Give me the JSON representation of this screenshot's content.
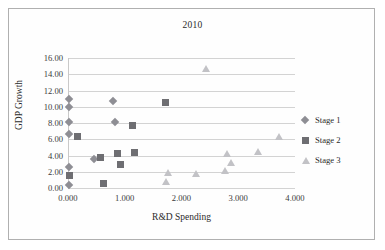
{
  "chart_data": {
    "type": "scatter",
    "title": "2010",
    "xlabel": "R&D Spending",
    "ylabel": "GDP Growth",
    "xlim": [
      0,
      4
    ],
    "ylim": [
      0,
      16
    ],
    "xticks": [
      "0.000",
      "1.000",
      "2.000",
      "3.000",
      "4.000"
    ],
    "xtick_values": [
      0,
      1,
      2,
      3,
      4
    ],
    "yticks": [
      "0.00",
      "2.00",
      "4.00",
      "6.00",
      "8.00",
      "10.00",
      "12.00",
      "14.00",
      "16.00"
    ],
    "ytick_values": [
      0,
      2,
      4,
      6,
      8,
      10,
      12,
      14,
      16
    ],
    "grid": "horizontal",
    "legend_position": "right",
    "series": [
      {
        "name": "Stage 1",
        "marker": "diamond",
        "color": "#8e8e94",
        "points": [
          {
            "x": 0.02,
            "y": 11.0
          },
          {
            "x": 0.02,
            "y": 10.0
          },
          {
            "x": 0.02,
            "y": 8.1
          },
          {
            "x": 0.02,
            "y": 6.7
          },
          {
            "x": 0.02,
            "y": 2.6
          },
          {
            "x": 0.02,
            "y": 0.4
          },
          {
            "x": 0.46,
            "y": 3.6
          },
          {
            "x": 0.8,
            "y": 10.7
          },
          {
            "x": 0.82,
            "y": 8.1
          }
        ]
      },
      {
        "name": "Stage 2",
        "marker": "square",
        "color": "#6e6e72",
        "points": [
          {
            "x": 0.02,
            "y": 1.6
          },
          {
            "x": 0.17,
            "y": 6.3
          },
          {
            "x": 0.58,
            "y": 3.8
          },
          {
            "x": 0.62,
            "y": 0.5
          },
          {
            "x": 0.87,
            "y": 4.2
          },
          {
            "x": 0.92,
            "y": 2.9
          },
          {
            "x": 1.14,
            "y": 7.7
          },
          {
            "x": 1.17,
            "y": 4.4
          },
          {
            "x": 1.72,
            "y": 10.5
          }
        ]
      },
      {
        "name": "Stage 3",
        "marker": "triangle",
        "color": "#c2c2c6",
        "points": [
          {
            "x": 1.72,
            "y": 0.8
          },
          {
            "x": 1.76,
            "y": 1.9
          },
          {
            "x": 2.25,
            "y": 1.8
          },
          {
            "x": 2.43,
            "y": 14.7
          },
          {
            "x": 2.77,
            "y": 2.2
          },
          {
            "x": 2.8,
            "y": 4.2
          },
          {
            "x": 2.88,
            "y": 3.1
          },
          {
            "x": 3.34,
            "y": 4.5
          },
          {
            "x": 3.72,
            "y": 6.4
          }
        ]
      }
    ]
  },
  "legend": {
    "items": [
      {
        "label": "Stage 1"
      },
      {
        "label": "Stage 2"
      },
      {
        "label": "Stage 3"
      }
    ]
  }
}
